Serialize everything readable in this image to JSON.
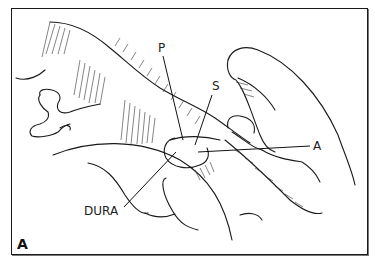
{
  "figure": {
    "panel_letter": "A",
    "labels": {
      "p": "P",
      "s": "S",
      "a": "A",
      "dura": "DURA"
    },
    "colors": {
      "line": "#1a1a1a",
      "background": "#ffffff"
    }
  }
}
